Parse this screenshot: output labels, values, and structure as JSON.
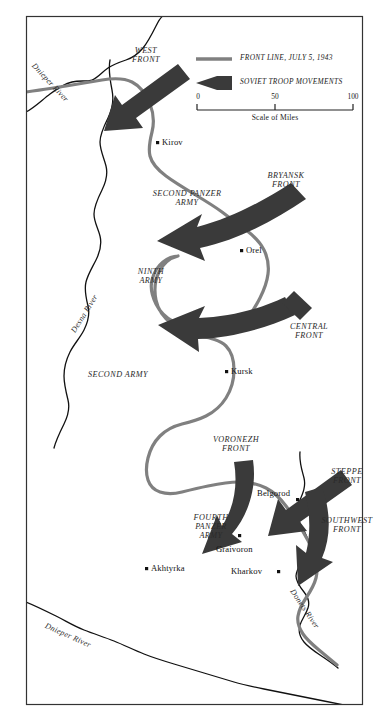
{
  "map": {
    "title": "Battle of Kursk, July 1943",
    "colors": {
      "front_line": "#808080",
      "arrow": "#3a3a3a",
      "river": "#111111",
      "border": "#333333",
      "text": "#1a1a1a",
      "background": "#ffffff"
    }
  },
  "legend": {
    "front_line_label": "FRONT LINE, JULY 5, 1943",
    "troop_movement_label": "SOVIET TROOP MOVEMENTS",
    "scale": {
      "caption": "Scale of Miles",
      "ticks": [
        "0",
        "50",
        "100"
      ]
    }
  },
  "fronts": [
    {
      "id": "west-front",
      "label": "WEST\nFRONT",
      "x": 145,
      "y": 50
    },
    {
      "id": "bryansk-front",
      "label": "BRYANSK\nFRONT",
      "x": 285,
      "y": 174
    },
    {
      "id": "central-front",
      "label": "CENTRAL\nFRONT",
      "x": 308,
      "y": 327
    },
    {
      "id": "voronezh-front",
      "label": "VORONEZH\nFRONT",
      "x": 236,
      "y": 440
    },
    {
      "id": "steppe-front",
      "label": "STEPPE\nFRONT",
      "x": 345,
      "y": 475
    },
    {
      "id": "southwest-front",
      "label": "SOUTHWEST\nFRONT",
      "x": 348,
      "y": 523
    }
  ],
  "armies": [
    {
      "id": "second-panzer-army",
      "label": "SECOND PANZER\nARMY",
      "x": 186,
      "y": 195
    },
    {
      "id": "ninth-army",
      "label": "NINTH\nARMY",
      "x": 150,
      "y": 272
    },
    {
      "id": "second-army",
      "label": "SECOND ARMY",
      "x": 117,
      "y": 375
    },
    {
      "id": "fourth-panzer-army",
      "label": "FOURTH\nPANZER\nARMY",
      "x": 210,
      "y": 521
    }
  ],
  "cities": [
    {
      "id": "kirov",
      "name": "Kirov",
      "dot_x": 158,
      "dot_y": 143,
      "label_x": 163,
      "label_y": 139
    },
    {
      "id": "orel",
      "name": "Orel",
      "dot_x": 242,
      "dot_y": 251,
      "label_x": 247,
      "label_y": 247
    },
    {
      "id": "kursk",
      "name": "Kursk",
      "dot_x": 227,
      "dot_y": 372,
      "label_x": 232,
      "label_y": 368
    },
    {
      "id": "belgorod",
      "name": "Belgorod",
      "dot_x": 298,
      "dot_y": 500,
      "label_x": 262,
      "label_y": 490
    },
    {
      "id": "graivoron",
      "name": "Graivoron",
      "dot_x": 240,
      "dot_y": 543,
      "label_x": 221,
      "label_y": 548
    },
    {
      "id": "akhtyrka",
      "name": "Akhtyrka",
      "dot_x": 147,
      "dot_y": 569,
      "label_x": 152,
      "label_y": 565
    },
    {
      "id": "kharkov",
      "name": "Kharkov",
      "dot_x": 272,
      "dot_y": 572,
      "label_x": 232,
      "label_y": 568
    }
  ],
  "rivers": [
    {
      "id": "dnieper-river-north",
      "name": "Dnieper River",
      "x": 36,
      "y": 62,
      "rotate": 47
    },
    {
      "id": "desna-river",
      "name": "Desna River",
      "x": 70,
      "y": 330,
      "rotate": -58
    },
    {
      "id": "dnieper-river-south",
      "name": "Dnieper River",
      "x": 47,
      "y": 622,
      "rotate": 24
    },
    {
      "id": "donets-river",
      "name": "Donets River",
      "x": 295,
      "y": 588,
      "rotate": 56
    }
  ]
}
